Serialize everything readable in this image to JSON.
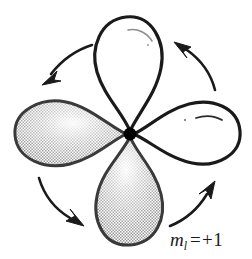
{
  "figure": {
    "background_color": "#ffffff",
    "width": 252,
    "height": 259,
    "outline_color": "#1a1a1a",
    "shaded_fill_color": "#b8b8b8",
    "unshaded_fill_color": "#ffffff",
    "nucleus_color": "#000000"
  },
  "label": {
    "symbol": "m",
    "subscript": "l",
    "equals": "=",
    "value": "+1",
    "full_text": "m_l = +1"
  },
  "nucleus": {
    "name": "center-nucleus-dot",
    "cx": 130,
    "cy": 134,
    "r": 6.5
  },
  "lobes": [
    {
      "name": "lobe-top",
      "orientation": "up",
      "shaded": false,
      "fill": "#ffffff",
      "highlight": "arc"
    },
    {
      "name": "lobe-right",
      "orientation": "right",
      "shaded": false,
      "fill": "#ffffff",
      "highlight": "arc"
    },
    {
      "name": "lobe-bottom",
      "orientation": "down",
      "shaded": true,
      "fill": "#b8b8b8",
      "highlight": "gradient"
    },
    {
      "name": "lobe-left",
      "orientation": "left",
      "shaded": true,
      "fill": "#b8b8b8",
      "highlight": "gradient"
    }
  ],
  "arrows": [
    {
      "name": "arrow-top-left",
      "direction": "down-left",
      "position": "upper-left quadrant"
    },
    {
      "name": "arrow-top-right",
      "direction": "up-left",
      "position": "upper-right quadrant"
    },
    {
      "name": "arrow-bottom-left",
      "direction": "down-right",
      "position": "lower-left quadrant"
    },
    {
      "name": "arrow-bottom-right",
      "direction": "up-right",
      "position": "lower-right quadrant"
    }
  ],
  "circulation": {
    "sense": "counterclockwise",
    "description": "four curved arrows encircling the orbital lobes"
  }
}
